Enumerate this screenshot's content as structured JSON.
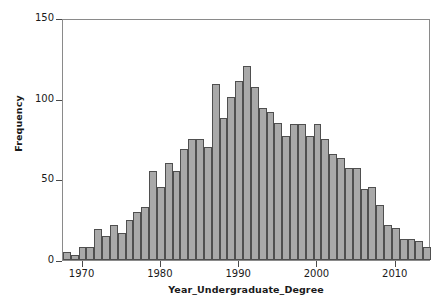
{
  "chart_data": {
    "type": "bar",
    "title": "",
    "subtitle": "",
    "xlabel": "Year_Undergraduate_Degree",
    "ylabel": "Frequency",
    "xlim": [
      1967.5,
      2014.5
    ],
    "ylim": [
      0,
      150
    ],
    "grid": false,
    "legend": null,
    "legend_position": "none",
    "bin_width": 1,
    "xticks": [
      1970,
      1980,
      1990,
      2000,
      2010
    ],
    "xtick_labels": [
      "1970",
      "1980",
      "1990",
      "2000",
      "2010"
    ],
    "yticks": [
      0,
      50,
      100,
      150
    ],
    "ytick_labels": [
      "0",
      "50",
      "100",
      "150"
    ],
    "categories": [
      1968,
      1969,
      1970,
      1971,
      1972,
      1973,
      1974,
      1975,
      1976,
      1977,
      1978,
      1979,
      1980,
      1981,
      1982,
      1983,
      1984,
      1985,
      1986,
      1987,
      1988,
      1989,
      1990,
      1991,
      1992,
      1993,
      1994,
      1995,
      1996,
      1997,
      1998,
      1999,
      2000,
      2001,
      2002,
      2003,
      2004,
      2005,
      2006,
      2007,
      2008,
      2009,
      2010,
      2011,
      2012,
      2013,
      2014
    ],
    "values": [
      5,
      3,
      8,
      8,
      19,
      15,
      22,
      17,
      25,
      30,
      33,
      55,
      45,
      60,
      55,
      69,
      75,
      75,
      70,
      109,
      88,
      101,
      111,
      120,
      107,
      94,
      92,
      85,
      77,
      84,
      84,
      77,
      84,
      75,
      66,
      63,
      57,
      57,
      44,
      45,
      34,
      22,
      20,
      13,
      13,
      12,
      8
    ],
    "bar_color": "#a9a9a9",
    "bar_edge_color": "#4f4f4f",
    "axis_color": "#8a8a8a",
    "text_color": "#1a1a1a"
  },
  "axes": {
    "ylabel": "Frequency",
    "xlabel": "Year_Undergraduate_Degree"
  },
  "figure": {
    "caption": ""
  }
}
